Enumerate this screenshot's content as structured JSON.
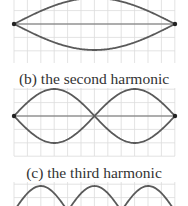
{
  "figure": {
    "panels": [
      {
        "id": "a",
        "caption": "",
        "harmonic": 1,
        "center_y": 24,
        "amplitude": 26,
        "nodes_x": [
          14,
          175
        ],
        "grid": {
          "x0": 14,
          "x1": 175,
          "y0": -4,
          "y1": 63
        }
      },
      {
        "id": "b",
        "caption": "(b) the second harmonic",
        "caption_y": 84,
        "harmonic": 2,
        "center_y": 116,
        "amplitude": 27,
        "nodes_x": [
          14,
          95,
          175
        ],
        "grid": {
          "x0": 14,
          "x1": 175,
          "y0": 88,
          "y1": 156
        }
      },
      {
        "id": "c",
        "caption": "(c) the third harmonic",
        "caption_y": 178,
        "harmonic": 3,
        "center_y": 211,
        "amplitude": 25,
        "nodes_x": [
          14,
          68,
          122,
          175
        ],
        "grid": {
          "x0": 14,
          "x1": 175,
          "y0": 182,
          "y1": 210
        }
      }
    ],
    "colors": {
      "wave": "#5a5a5a",
      "axis": "#6a6a6a",
      "grid": "#dcdcdc",
      "node": "#222222",
      "text": "#333333"
    }
  }
}
